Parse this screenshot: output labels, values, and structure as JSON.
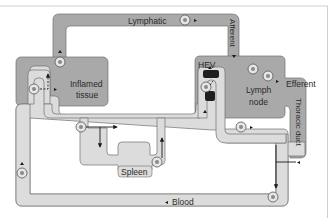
{
  "diagram": {
    "labels": {
      "lymphatic": "Lymphatic",
      "afferent": "Afferent",
      "inflamed_tissue_line1": "Inflamed",
      "inflamed_tissue_line2": "tissue",
      "hev": "HEV",
      "lymph_node_line1": "Lymph",
      "lymph_node_line2": "node",
      "efferent": "Efferent",
      "thoracic_duct": "Thoracic duct",
      "spleen": "Spleen",
      "blood": "Blood"
    },
    "colors": {
      "lymph_vessel": "#a9a9a9",
      "blood_vessel": "#dcdcdc",
      "outline": "#6e6e6e",
      "hev": "#1e1e1e",
      "frame": "#c8c8c8"
    }
  }
}
